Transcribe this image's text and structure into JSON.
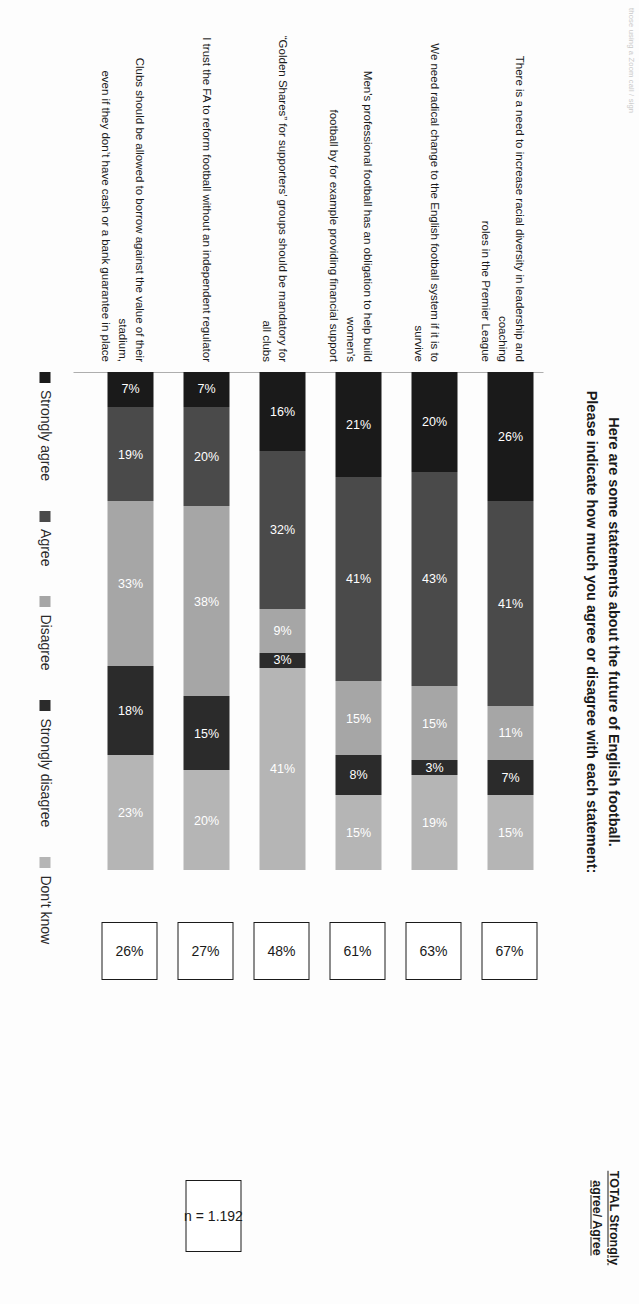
{
  "corner_note": "those using a Zoom call / sign",
  "title": {
    "line1": "Here are some statements about the future of English football.",
    "line2": "Please indicate how much you agree or disagree with each statement:"
  },
  "total_header": {
    "line1": "TOTAL Strongly",
    "line2": "agree/ Agree"
  },
  "sample": {
    "label": "n = 1.192"
  },
  "legend": [
    {
      "label": "Strongly agree",
      "color": "#1a1a1a"
    },
    {
      "label": "Agree",
      "color": "#4a4a4a"
    },
    {
      "label": "Disagree",
      "color": "#a6a6a6"
    },
    {
      "label": "Strongly disagree",
      "color": "#2b2b2b"
    },
    {
      "label": "Don't know",
      "color": "#b5b5b5"
    }
  ],
  "chart_data": {
    "type": "bar",
    "subtype": "stacked-horizontal-100",
    "title": "Here are some statements about the future of English football. Please indicate how much you agree or disagree with each statement:",
    "xlabel": "",
    "ylabel": "",
    "xlim": [
      0,
      100
    ],
    "grid": false,
    "legend_position": "bottom",
    "value_suffix": "%",
    "categories": [
      "There is a need to increase racial diversity in leadership and coaching roles in the Premier League",
      "We need radical change to the English football system if it is to survive",
      "Men's professional football has an obligation to help build women's football by for example providing financial support",
      "“Golden Shares” for supporters’ groups should be mandatory for all clubs",
      "I trust the FA to reform football without an independent regulator",
      "Clubs should be allowed to borrow against the value of their stadium, even if they don’t have cash or a bank guarantee in place"
    ],
    "series": [
      {
        "name": "Strongly agree",
        "color": "#1a1a1a",
        "values": [
          26,
          20,
          21,
          16,
          7,
          7
        ]
      },
      {
        "name": "Agree",
        "color": "#4a4a4a",
        "values": [
          41,
          43,
          41,
          32,
          20,
          19
        ]
      },
      {
        "name": "Disagree",
        "color": "#a6a6a6",
        "values": [
          11,
          15,
          15,
          9,
          38,
          33
        ]
      },
      {
        "name": "Strongly disagree",
        "color": "#2b2b2b",
        "values": [
          7,
          3,
          8,
          3,
          15,
          18
        ]
      },
      {
        "name": "Don't know",
        "color": "#b5b5b5",
        "values": [
          15,
          19,
          15,
          41,
          20,
          23
        ]
      }
    ],
    "totals_label": "TOTAL Strongly agree/ Agree",
    "totals": [
      67,
      63,
      61,
      48,
      27,
      26
    ],
    "n": 1192
  },
  "rows": [
    {
      "statement_lines": [
        "There is a need to increase racial diversity in leadership and coaching",
        "roles in the Premier League"
      ],
      "total": "67%",
      "segments": [
        {
          "label": "26%",
          "value": 26,
          "color": "#1a1a1a",
          "text": "#ffffff"
        },
        {
          "label": "41%",
          "value": 41,
          "color": "#4a4a4a",
          "text": "#ffffff"
        },
        {
          "label": "11%",
          "value": 11,
          "color": "#a6a6a6",
          "text": "#ffffff"
        },
        {
          "label": "7%",
          "value": 7,
          "color": "#2b2b2b",
          "text": "#ffffff"
        },
        {
          "label": "15%",
          "value": 15,
          "color": "#b5b5b5",
          "text": "#ffffff"
        }
      ]
    },
    {
      "statement_lines": [
        "We need radical change to the English football system if it is to survive"
      ],
      "total": "63%",
      "segments": [
        {
          "label": "20%",
          "value": 20,
          "color": "#1a1a1a",
          "text": "#ffffff"
        },
        {
          "label": "43%",
          "value": 43,
          "color": "#4a4a4a",
          "text": "#ffffff"
        },
        {
          "label": "15%",
          "value": 15,
          "color": "#a6a6a6",
          "text": "#ffffff"
        },
        {
          "label": "3%",
          "value": 3,
          "color": "#2b2b2b",
          "text": "#ffffff"
        },
        {
          "label": "19%",
          "value": 19,
          "color": "#b5b5b5",
          "text": "#ffffff"
        }
      ]
    },
    {
      "statement_lines": [
        "Men's professional football has an obligation to help build women's",
        "football by for example providing financial support"
      ],
      "total": "61%",
      "segments": [
        {
          "label": "21%",
          "value": 21,
          "color": "#1a1a1a",
          "text": "#ffffff"
        },
        {
          "label": "41%",
          "value": 41,
          "color": "#4a4a4a",
          "text": "#ffffff"
        },
        {
          "label": "15%",
          "value": 15,
          "color": "#a6a6a6",
          "text": "#ffffff"
        },
        {
          "label": "8%",
          "value": 8,
          "color": "#2b2b2b",
          "text": "#ffffff"
        },
        {
          "label": "15%",
          "value": 15,
          "color": "#b5b5b5",
          "text": "#ffffff"
        }
      ]
    },
    {
      "statement_lines": [
        "“Golden Shares” for supporters’ groups should be mandatory for all clubs"
      ],
      "total": "48%",
      "segments": [
        {
          "label": "16%",
          "value": 16,
          "color": "#1a1a1a",
          "text": "#ffffff"
        },
        {
          "label": "32%",
          "value": 32,
          "color": "#4a4a4a",
          "text": "#ffffff"
        },
        {
          "label": "9%",
          "value": 9,
          "color": "#a6a6a6",
          "text": "#ffffff"
        },
        {
          "label": "3%",
          "value": 3,
          "color": "#2b2b2b",
          "text": "#ffffff"
        },
        {
          "label": "41%",
          "value": 41,
          "color": "#b5b5b5",
          "text": "#ffffff"
        }
      ]
    },
    {
      "statement_lines": [
        "I trust the FA to reform football without an independent regulator"
      ],
      "total": "27%",
      "segments": [
        {
          "label": "7%",
          "value": 7,
          "color": "#1a1a1a",
          "text": "#ffffff"
        },
        {
          "label": "20%",
          "value": 20,
          "color": "#4a4a4a",
          "text": "#ffffff"
        },
        {
          "label": "38%",
          "value": 38,
          "color": "#a6a6a6",
          "text": "#ffffff"
        },
        {
          "label": "15%",
          "value": 15,
          "color": "#2b2b2b",
          "text": "#ffffff"
        },
        {
          "label": "20%",
          "value": 20,
          "color": "#b5b5b5",
          "text": "#ffffff"
        }
      ]
    },
    {
      "statement_lines": [
        "Clubs should be allowed to borrow against the value of their stadium,",
        "even if they don’t have cash or a bank guarantee in place"
      ],
      "total": "26%",
      "segments": [
        {
          "label": "7%",
          "value": 7,
          "color": "#1a1a1a",
          "text": "#ffffff"
        },
        {
          "label": "19%",
          "value": 19,
          "color": "#4a4a4a",
          "text": "#ffffff"
        },
        {
          "label": "33%",
          "value": 33,
          "color": "#a6a6a6",
          "text": "#ffffff"
        },
        {
          "label": "18%",
          "value": 18,
          "color": "#2b2b2b",
          "text": "#ffffff"
        },
        {
          "label": "23%",
          "value": 23,
          "color": "#b5b5b5",
          "text": "#ffffff"
        }
      ]
    }
  ]
}
